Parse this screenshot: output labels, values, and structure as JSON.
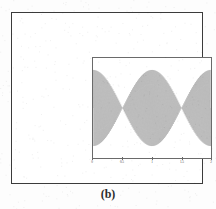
{
  "figure": {
    "caption": "(b)",
    "background_color": "#ffffff",
    "frame_color": "#3b3b3b",
    "axes_color": "#6a6a6a",
    "trace_color": "#4d4d4d"
  },
  "chart_data": {
    "type": "line",
    "title": "",
    "subtitle": "",
    "xlabel": "",
    "ylabel": "",
    "xlim": [
      0,
      2
    ],
    "ylim": [
      -1.5,
      1.5
    ],
    "xticks": [
      0,
      0.5,
      1,
      1.5,
      2
    ],
    "xtick_labels": [
      "0",
      "0.5",
      "1",
      "1.5",
      "2"
    ],
    "yticks": [
      -1,
      0,
      1
    ],
    "ytick_labels": [
      "-1",
      "0",
      "1"
    ],
    "grid": false,
    "legend": null,
    "legend_position": "none",
    "annotations": [],
    "series": [
      {
        "name": "modulated signal",
        "description": "Densely oscillating amplitude-modulated waveform with a beat envelope; envelope is maximal at x=0, x=1 and x=2 and collapses to near zero at x=0.5 and x=1.5, producing a repeated bow-tie / hourglass shape.",
        "carrier_frequency": 60,
        "envelope_frequency": 1,
        "amplitude": 1.2,
        "samples": 1200
      }
    ]
  }
}
